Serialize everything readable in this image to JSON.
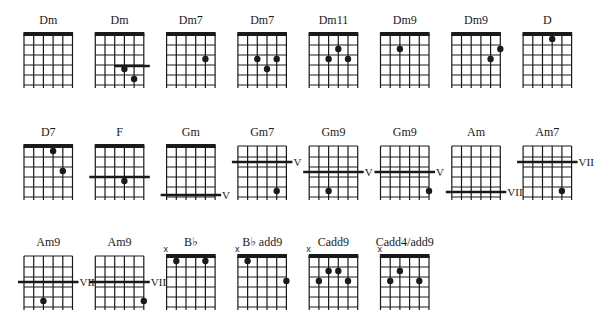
{
  "colors": {
    "ink": "#1a1a1a",
    "background": "#ffffff"
  },
  "rows": [
    {
      "chords": [
        {
          "name": "Dm",
          "nut": true,
          "dots": [],
          "barre": null,
          "muted": []
        },
        {
          "name": "Dm",
          "nut": true,
          "dots": [
            {
              "string": 4,
              "fret": 4
            },
            {
              "string": 5,
              "fret": 5
            }
          ],
          "barre": {
            "fret_line": 3.2,
            "from_string": 3,
            "to_string": 6,
            "extend_right": true,
            "label": ""
          },
          "muted": []
        },
        {
          "name": "Dm7",
          "nut": true,
          "dots": [
            {
              "string": 5,
              "fret": 3
            }
          ],
          "barre": null,
          "muted": []
        },
        {
          "name": "Dm7",
          "nut": true,
          "dots": [
            {
              "string": 3,
              "fret": 3
            },
            {
              "string": 5,
              "fret": 3
            },
            {
              "string": 4,
              "fret": 4
            }
          ],
          "barre": null,
          "muted": []
        },
        {
          "name": "Dm11",
          "nut": true,
          "dots": [
            {
              "string": 4,
              "fret": 2
            },
            {
              "string": 3,
              "fret": 3
            },
            {
              "string": 5,
              "fret": 3
            }
          ],
          "barre": null,
          "muted": []
        },
        {
          "name": "Dm9",
          "nut": true,
          "dots": [
            {
              "string": 3,
              "fret": 2
            }
          ],
          "barre": null,
          "muted": []
        },
        {
          "name": "Dm9",
          "nut": true,
          "dots": [
            {
              "string": 6,
              "fret": 2
            },
            {
              "string": 5,
              "fret": 3
            }
          ],
          "barre": null,
          "muted": []
        },
        {
          "name": "D",
          "nut": true,
          "dots": [
            {
              "string": 4,
              "fret": 1
            }
          ],
          "barre": null,
          "muted": []
        }
      ]
    },
    {
      "chords": [
        {
          "name": "D7",
          "nut": true,
          "dots": [
            {
              "string": 4,
              "fret": 1
            },
            {
              "string": 5,
              "fret": 3
            }
          ],
          "barre": null,
          "muted": []
        },
        {
          "name": "F",
          "nut": true,
          "dots": [
            {
              "string": 4,
              "fret": 4
            }
          ],
          "barre": {
            "fret_line": 3.1,
            "from_string": 1,
            "to_string": 6,
            "extend_left": true,
            "extend_right": true,
            "label": ""
          },
          "muted": []
        },
        {
          "name": "Gm",
          "nut": true,
          "dots": [],
          "barre": {
            "fret_line": 4.9,
            "from_string": 1,
            "to_string": 6,
            "extend_left": true,
            "extend_right": true,
            "label": "V"
          },
          "muted": []
        },
        {
          "name": "Gm7",
          "nut": false,
          "dots": [
            {
              "string": 5,
              "fret": 5
            }
          ],
          "barre": {
            "fret_line": 1.6,
            "from_string": 1,
            "to_string": 6,
            "extend_left": true,
            "extend_right": true,
            "label": "V"
          },
          "muted": []
        },
        {
          "name": "Gm9",
          "nut": false,
          "dots": [
            {
              "string": 3,
              "fret": 5
            }
          ],
          "barre": {
            "fret_line": 2.6,
            "from_string": 1,
            "to_string": 6,
            "extend_left": true,
            "extend_right": true,
            "label": "V"
          },
          "muted": []
        },
        {
          "name": "Gm9",
          "nut": false,
          "dots": [
            {
              "string": 6,
              "fret": 5
            }
          ],
          "barre": {
            "fret_line": 2.6,
            "from_string": 1,
            "to_string": 6,
            "extend_left": true,
            "extend_right": true,
            "label": "V"
          },
          "muted": []
        },
        {
          "name": "Am",
          "nut": false,
          "dots": [],
          "barre": {
            "fret_line": 4.6,
            "from_string": 1,
            "to_string": 6,
            "extend_left": true,
            "extend_right": true,
            "label": "VII"
          },
          "muted": []
        },
        {
          "name": "Am7",
          "nut": false,
          "dots": [
            {
              "string": 5,
              "fret": 5
            }
          ],
          "barre": {
            "fret_line": 1.6,
            "from_string": 1,
            "to_string": 6,
            "extend_left": true,
            "extend_right": true,
            "label": "VII"
          },
          "muted": []
        }
      ]
    },
    {
      "chords": [
        {
          "name": "Am9",
          "nut": false,
          "dots": [
            {
              "string": 3,
              "fret": 5
            }
          ],
          "barre": {
            "fret_line": 2.6,
            "from_string": 1,
            "to_string": 6,
            "extend_left": true,
            "extend_right": true,
            "label": "VII"
          },
          "muted": []
        },
        {
          "name": "Am9",
          "nut": false,
          "dots": [
            {
              "string": 6,
              "fret": 5
            }
          ],
          "barre": {
            "fret_line": 2.6,
            "from_string": 1,
            "to_string": 6,
            "extend_left": true,
            "extend_right": true,
            "label": "VII"
          },
          "muted": []
        },
        {
          "name": "B♭",
          "nut": true,
          "dots": [
            {
              "string": 2,
              "fret": 1
            },
            {
              "string": 5,
              "fret": 1
            }
          ],
          "barre": null,
          "muted": [
            1
          ]
        },
        {
          "name": "B♭ add9",
          "nut": true,
          "dots": [
            {
              "string": 2,
              "fret": 1
            },
            {
              "string": 6,
              "fret": 3
            }
          ],
          "barre": null,
          "muted": [
            1
          ]
        },
        {
          "name": "Cadd9",
          "nut": true,
          "dots": [
            {
              "string": 3,
              "fret": 2
            },
            {
              "string": 4,
              "fret": 2
            },
            {
              "string": 2,
              "fret": 3
            },
            {
              "string": 5,
              "fret": 3
            }
          ],
          "barre": null,
          "muted": [
            1
          ]
        },
        {
          "name": "Cadd4/add9",
          "nut": true,
          "dots": [
            {
              "string": 3,
              "fret": 2
            },
            {
              "string": 2,
              "fret": 3
            },
            {
              "string": 5,
              "fret": 3
            }
          ],
          "barre": null,
          "muted": [
            1
          ]
        }
      ]
    }
  ]
}
